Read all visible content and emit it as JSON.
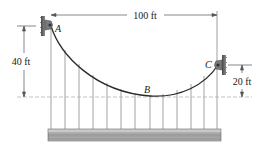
{
  "figure": {
    "type": "suspension-cable-diagram",
    "points": {
      "A": {
        "label": "A",
        "x": 50,
        "y": 25
      },
      "B": {
        "label": "B",
        "x": 150,
        "y": 96
      },
      "C": {
        "label": "C",
        "x": 217,
        "y": 65
      }
    },
    "dimensions": {
      "span": {
        "label": "100 ft"
      },
      "height_A": {
        "label": "40 ft"
      },
      "height_C": {
        "label": "20 ft"
      }
    },
    "hangers_x": [
      51,
      65,
      79,
      93,
      107,
      121,
      135,
      150,
      163,
      177,
      191,
      204,
      217
    ],
    "colors": {
      "cable": "#2a2a2a",
      "hanger": "#8a8a8a",
      "support": "#6b6b6b",
      "deck_top": "#b0b0b0",
      "deck_bottom": "#8c8c8c",
      "dim_line": "#555555"
    }
  }
}
